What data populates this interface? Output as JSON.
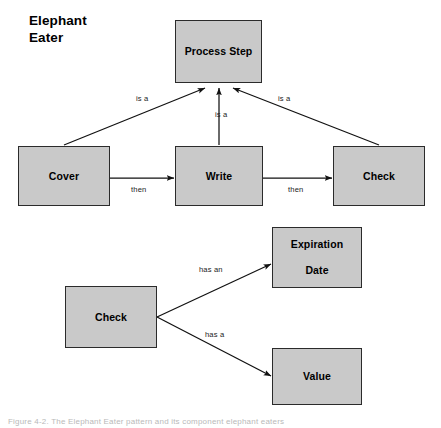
{
  "figure": {
    "title_lines": [
      "Elephant",
      "Eater"
    ],
    "caption": "Figure 4-2. The Elephant Eater pattern and its component elephant eaters",
    "box_fill_color": "#c9c9c9",
    "box_border_color": "#2b2b2b",
    "background_color": "#ffffff"
  },
  "top_diagram": {
    "nodes": [
      {
        "id": "process-step",
        "label": "Process Step"
      },
      {
        "id": "cover",
        "label": "Cover"
      },
      {
        "id": "write",
        "label": "Write"
      },
      {
        "id": "check",
        "label": "Check"
      }
    ],
    "edges": [
      {
        "from": "cover",
        "to": "process-step",
        "label": "is a"
      },
      {
        "from": "write",
        "to": "process-step",
        "label": "is a"
      },
      {
        "from": "check",
        "to": "process-step",
        "label": "is a"
      },
      {
        "from": "cover",
        "to": "write",
        "label": "then"
      },
      {
        "from": "write",
        "to": "check",
        "label": "then"
      }
    ],
    "labels": {
      "is_a_left": "is a",
      "is_a_center": "is a",
      "is_a_right": "is a",
      "then_left": "then",
      "then_right": "then"
    }
  },
  "bottom_diagram": {
    "nodes": [
      {
        "id": "check-2",
        "label": "Check"
      },
      {
        "id": "expiration-date",
        "label": "Expiration Date"
      },
      {
        "id": "value",
        "label": "Value"
      }
    ],
    "edges": [
      {
        "from": "check-2",
        "to": "expiration-date",
        "label": "has an"
      },
      {
        "from": "check-2",
        "to": "value",
        "label": "has a"
      }
    ],
    "labels": {
      "has_an": "has an",
      "has_a": "has a"
    },
    "node_text": {
      "expiration_date_line1": "Expiration",
      "expiration_date_line2": "Date"
    }
  }
}
